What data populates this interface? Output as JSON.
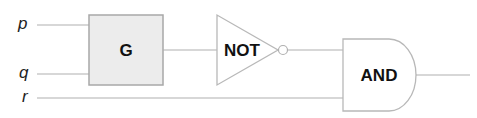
{
  "diagram": {
    "inputs": [
      {
        "id": "p",
        "label": "p"
      },
      {
        "id": "q",
        "label": "q"
      },
      {
        "id": "r",
        "label": "r"
      }
    ],
    "gates": {
      "g": {
        "label": "G",
        "fill": "#ececec",
        "stroke": "#a8a8a8"
      },
      "not": {
        "label": "NOT"
      },
      "and": {
        "label": "AND"
      }
    },
    "colors": {
      "wire": "#b0b0b0",
      "gate_stroke": "#b8b8b8"
    }
  }
}
